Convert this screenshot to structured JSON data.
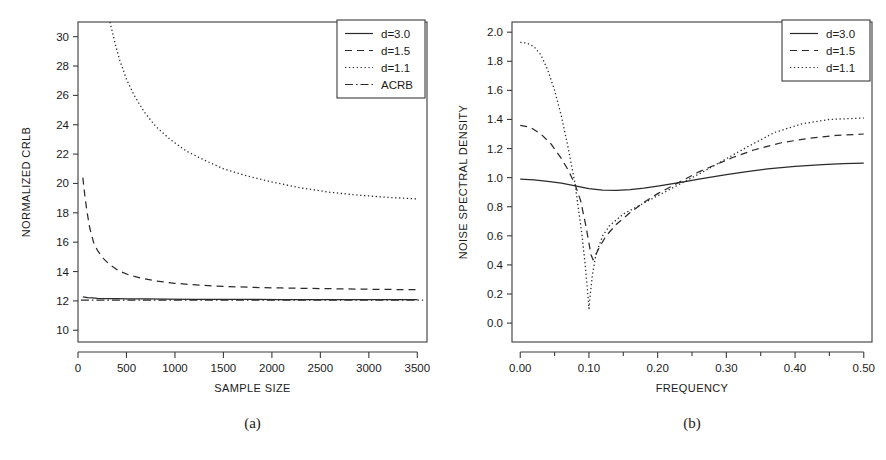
{
  "figure": {
    "background": "#ffffff",
    "ink_color": "#2b2b2b"
  },
  "panels": [
    {
      "id": "a",
      "caption": "(a)",
      "chart_data": {
        "type": "line",
        "title": "",
        "xlabel": "SAMPLE SIZE",
        "ylabel": "NORMALIZED CRLB",
        "xlim": [
          0,
          3600
        ],
        "ylim": [
          9.2,
          31.0
        ],
        "xticks": [
          0,
          500,
          1000,
          1500,
          2000,
          2500,
          3000,
          3500
        ],
        "xticklabels": [
          "0",
          "500",
          "1000",
          "1500",
          "2000",
          "2500",
          "3000",
          "3500"
        ],
        "yticks": [
          10,
          12,
          14,
          16,
          18,
          20,
          22,
          24,
          26,
          28,
          30
        ],
        "yticklabels": [
          "10",
          "12",
          "14",
          "16",
          "18",
          "20",
          "22",
          "24",
          "26",
          "28",
          "30"
        ],
        "grid": false,
        "legend_position": "top-right",
        "series": [
          {
            "name": "d=3.0",
            "style": "solid",
            "x": [
              50,
              100,
              150,
              200,
              300,
              400,
              500,
              700,
              900,
              1200,
              1500,
              1800,
              2100,
              2500,
              2900,
              3200,
              3500
            ],
            "y": [
              12.28,
              12.22,
              12.2,
              12.18,
              12.16,
              12.15,
              12.14,
              12.13,
              12.12,
              12.11,
              12.1,
              12.1,
              12.09,
              12.09,
              12.08,
              12.08,
              12.08
            ]
          },
          {
            "name": "d=1.5",
            "style": "dashed",
            "x": [
              50,
              70,
              90,
              120,
              160,
              200,
              260,
              330,
              420,
              520,
              650,
              800,
              1000,
              1250,
              1500,
              1800,
              2100,
              2500,
              2900,
              3200,
              3500
            ],
            "y": [
              20.4,
              19.2,
              18.2,
              17.0,
              16.0,
              15.45,
              14.9,
              14.45,
              14.05,
              13.78,
              13.55,
              13.36,
              13.2,
              13.07,
              12.99,
              12.92,
              12.88,
              12.84,
              12.8,
              12.78,
              12.76
            ]
          },
          {
            "name": "d=1.1",
            "style": "dotted",
            "x": [
              330,
              380,
              430,
              500,
              580,
              680,
              800,
              950,
              1120,
              1300,
              1500,
              1750,
              2000,
              2300,
              2600,
              2900,
              3200,
              3500
            ],
            "y": [
              31.0,
              29.6,
              28.4,
              27.1,
              26.0,
              24.9,
              23.9,
              23.0,
              22.2,
              21.6,
              21.0,
              20.5,
              20.1,
              19.7,
              19.4,
              19.2,
              19.05,
              18.95
            ]
          },
          {
            "name": "ACRB",
            "style": "dashdot",
            "x": [
              30,
              3560
            ],
            "y": [
              12.05,
              12.05
            ]
          }
        ],
        "legend": [
          {
            "label": "d=3.0",
            "style": "solid"
          },
          {
            "label": "d=1.5",
            "style": "dashed"
          },
          {
            "label": "d=1.1",
            "style": "dotted"
          },
          {
            "label": "ACRB",
            "style": "dashdot"
          }
        ]
      }
    },
    {
      "id": "b",
      "caption": "(b)",
      "chart_data": {
        "type": "line",
        "title": "",
        "xlabel": "FREQUENCY",
        "ylabel": "NOISE SPECTRAL DENSITY",
        "xlim": [
          -0.012,
          0.512
        ],
        "ylim": [
          -0.13,
          2.07
        ],
        "xticks": [
          0.0,
          0.1,
          0.2,
          0.3,
          0.4,
          0.5
        ],
        "xticklabels": [
          "0.00",
          "0.10",
          "0.20",
          "0.30",
          "0.40",
          "0.50"
        ],
        "xminorticks": [
          0.05,
          0.15,
          0.25,
          0.35,
          0.45
        ],
        "yticks": [
          0.0,
          0.2,
          0.4,
          0.6,
          0.8,
          1.0,
          1.2,
          1.4,
          1.6,
          1.8,
          2.0
        ],
        "yticklabels": [
          "0.0",
          "0.2",
          "0.4",
          "0.6",
          "0.8",
          "1.0",
          "1.2",
          "1.4",
          "1.6",
          "1.8",
          "2.0"
        ],
        "grid": false,
        "legend_position": "top-right",
        "series": [
          {
            "name": "d=3.0",
            "style": "solid",
            "x": [
              0.0,
              0.02,
              0.04,
              0.06,
              0.08,
              0.1,
              0.12,
              0.14,
              0.16,
              0.18,
              0.2,
              0.22,
              0.24,
              0.26,
              0.28,
              0.3,
              0.33,
              0.36,
              0.4,
              0.44,
              0.47,
              0.5
            ],
            "y": [
              0.99,
              0.985,
              0.975,
              0.962,
              0.944,
              0.925,
              0.914,
              0.912,
              0.917,
              0.928,
              0.942,
              0.957,
              0.973,
              0.989,
              1.005,
              1.02,
              1.042,
              1.06,
              1.078,
              1.09,
              1.096,
              1.1
            ]
          },
          {
            "name": "d=1.5",
            "style": "dashed",
            "x": [
              0.0,
              0.015,
              0.03,
              0.045,
              0.06,
              0.07,
              0.08,
              0.088,
              0.095,
              0.1,
              0.103,
              0.106,
              0.11,
              0.115,
              0.125,
              0.14,
              0.16,
              0.18,
              0.2,
              0.22,
              0.24,
              0.26,
              0.28,
              0.31,
              0.34,
              0.38,
              0.42,
              0.46,
              0.5
            ],
            "y": [
              1.36,
              1.345,
              1.3,
              1.23,
              1.13,
              1.05,
              0.95,
              0.84,
              0.68,
              0.55,
              0.47,
              0.435,
              0.47,
              0.52,
              0.6,
              0.68,
              0.76,
              0.83,
              0.89,
              0.94,
              0.99,
              1.04,
              1.08,
              1.14,
              1.19,
              1.24,
              1.27,
              1.29,
              1.3
            ]
          },
          {
            "name": "d=1.1",
            "style": "dotted",
            "x": [
              0.0,
              0.01,
              0.02,
              0.03,
              0.04,
              0.05,
              0.06,
              0.07,
              0.08,
              0.09,
              0.095,
              0.098,
              0.1,
              0.102,
              0.105,
              0.11,
              0.12,
              0.13,
              0.15,
              0.17,
              0.19,
              0.21,
              0.23,
              0.25,
              0.27,
              0.3,
              0.33,
              0.37,
              0.41,
              0.45,
              0.5
            ],
            "y": [
              1.93,
              1.925,
              1.9,
              1.845,
              1.74,
              1.6,
              1.42,
              1.2,
              0.95,
              0.6,
              0.38,
              0.22,
              0.1,
              0.2,
              0.33,
              0.47,
              0.6,
              0.67,
              0.75,
              0.8,
              0.85,
              0.9,
              0.95,
              1.0,
              1.05,
              1.13,
              1.21,
              1.31,
              1.37,
              1.4,
              1.41
            ]
          }
        ],
        "legend": [
          {
            "label": "d=3.0",
            "style": "solid"
          },
          {
            "label": "d=1.5",
            "style": "dashed"
          },
          {
            "label": "d=1.1",
            "style": "dotted"
          }
        ]
      }
    }
  ]
}
